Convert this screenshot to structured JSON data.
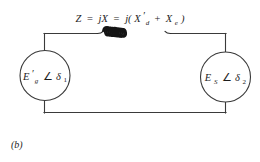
{
  "figure": {
    "caption": "(b)",
    "impedance_equation": {
      "full_text": "Z = jX = j(X'd + Xe)",
      "lhs_symbol": "Z",
      "equals": "=",
      "middle_term": "jX",
      "rhs_open": "j(",
      "term1_base": "X",
      "term1_prime": "′",
      "term1_subscript": "d",
      "plus": "+",
      "term2_base": "X",
      "term2_subscript": "e",
      "rhs_close": ")"
    },
    "left_source": {
      "label_full": "E'g ∠ δ1",
      "base": "E",
      "prime": "′",
      "subscript": "g",
      "angle_symbol": "∠",
      "angle_base": "δ",
      "angle_subscript": "1"
    },
    "right_source": {
      "label_full": "ES ∠ δ2",
      "base": "E",
      "prime": "",
      "subscript": "S",
      "angle_symbol": "∠",
      "angle_base": "δ",
      "angle_subscript": "2"
    },
    "components": {
      "inductor_name": "inductor-coil",
      "inductor_loops": 9
    },
    "colors": {
      "background": "#ffffff",
      "wire": "#3a3a3a",
      "coil": "#141414",
      "text": "#1d1d1d"
    }
  }
}
